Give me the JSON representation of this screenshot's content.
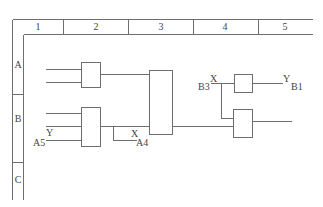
{
  "grid": {
    "columns": [
      "1",
      "2",
      "3",
      "4",
      "5"
    ],
    "rows": [
      "A",
      "B",
      "C"
    ]
  },
  "gates": [
    {
      "id": "gate-a2",
      "zone": "A2"
    },
    {
      "id": "gate-b2",
      "zone": "B2"
    },
    {
      "id": "gate-main",
      "zone": "A3-B3"
    },
    {
      "id": "gate-a4",
      "zone": "A4"
    },
    {
      "id": "gate-b4",
      "zone": "B4"
    }
  ],
  "labels": {
    "a5_signal": "Y",
    "a5_ref": "A5",
    "a4_signal": "X",
    "a4_ref": "A4",
    "b3_ref": "B3",
    "b3_signal": "X",
    "b1_signal": "Y",
    "b1_ref": "B1"
  },
  "colors": {
    "line": "#6e6e6e",
    "text": "#444444"
  }
}
